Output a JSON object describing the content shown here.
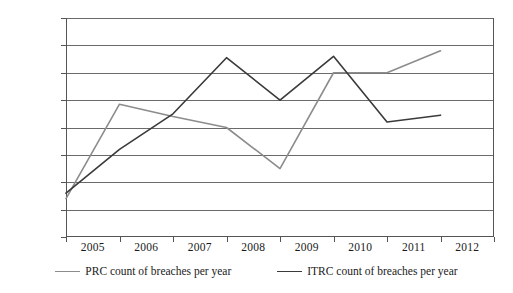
{
  "chart_data": {
    "type": "line",
    "title": "",
    "xlabel": "",
    "ylabel": "",
    "categories": [
      "2005",
      "2006",
      "2007",
      "2008",
      "2009",
      "2010",
      "2011",
      "2012"
    ],
    "ylim": [
      0,
      800
    ],
    "ytick_values": [
      800,
      700,
      600,
      500,
      400,
      300,
      200,
      100,
      0
    ],
    "ytick_labels": [
      "800",
      "700",
      "600",
      "500",
      "400",
      "300",
      "200",
      "100",
      "0"
    ],
    "grid": true,
    "legend_position": "bottom",
    "series": [
      {
        "name": "PRC count of breaches per year",
        "color": "#8c8c8c",
        "values": [
          140,
          485,
          440,
          400,
          250,
          600,
          600,
          680
        ]
      },
      {
        "name": "ITRC count of breaches per year",
        "color": "#3a3a3a",
        "values": [
          160,
          320,
          450,
          655,
          500,
          660,
          420,
          445
        ]
      }
    ]
  },
  "legend": {
    "entries": [
      {
        "label": "PRC count of breaches per year"
      },
      {
        "label": "ITRC count of breaches per year"
      }
    ]
  },
  "colors": {
    "prc_line": "#8c8c8c",
    "itrc_line": "#3a3a3a",
    "gridline": "#6a6a6a",
    "axis": "#555555",
    "text": "#1a1a1a",
    "background": "#ffffff"
  }
}
